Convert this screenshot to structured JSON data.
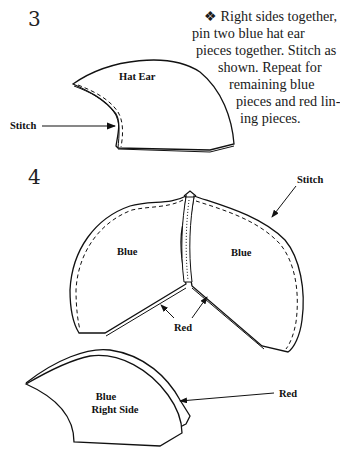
{
  "steps": [
    {
      "number": "3",
      "instruction_lines": [
        "❖ Right sides together,",
        "pin two blue hat ear",
        "pieces together. Stitch as",
        "shown. Repeat for",
        "remaining blue",
        "pieces and red lin-",
        "ing pieces."
      ],
      "figure": {
        "piece_label": "Hat Ear",
        "callout": "Stitch"
      }
    },
    {
      "number": "4",
      "figure": {
        "left_piece_label": "Blue",
        "right_piece_label": "Blue",
        "callout_stitch": "Stitch",
        "callout_red": "Red"
      }
    }
  ],
  "bottom_figure": {
    "piece_label_line1": "Blue",
    "piece_label_line2": "Right Side",
    "callout": "Red"
  }
}
